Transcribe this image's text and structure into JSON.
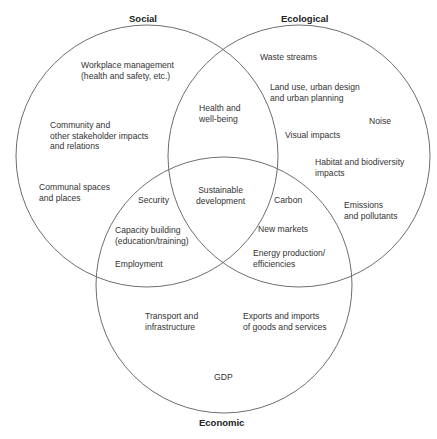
{
  "diagram": {
    "type": "venn",
    "circles": [
      {
        "name": "Social",
        "cx": 147,
        "cy": 156,
        "r": 131
      },
      {
        "name": "Ecological",
        "cx": 299,
        "cy": 156,
        "r": 131
      },
      {
        "name": "Economic",
        "cx": 224,
        "cy": 285,
        "r": 128
      }
    ],
    "stroke_color": "#6e6e6e"
  },
  "titles": {
    "social": "Social",
    "ecological": "Ecological",
    "economic": "Economic"
  },
  "social_only": {
    "workplace": "Workplace management\n(health and safety, etc.)",
    "community": "Community and\nother stakeholder impacts\nand relations",
    "communal": "Communal spaces\nand places"
  },
  "ecological_only": {
    "waste": "Waste streams",
    "land_use": "Land use, urban design\nand urban planning",
    "noise": "Noise",
    "visual": "Visual impacts",
    "habitat": "Habitat and biodiversity\nimpacts",
    "emissions": "Emissions\nand pollutants"
  },
  "economic_only": {
    "transport": "Transport and\ninfrastructure",
    "exports": "Exports and imports\nof goods and services",
    "gdp": "GDP"
  },
  "social_ecological": {
    "health": "Health and\nwell-being"
  },
  "social_economic": {
    "security": "Security",
    "capacity": "Capacity building\n(education/training)",
    "employment": "Employment"
  },
  "ecological_economic": {
    "carbon": "Carbon",
    "new_markets": "New markets",
    "energy": "Energy production/\nefficiencies"
  },
  "center": {
    "sustainable": "Sustainable\ndevelopment"
  }
}
